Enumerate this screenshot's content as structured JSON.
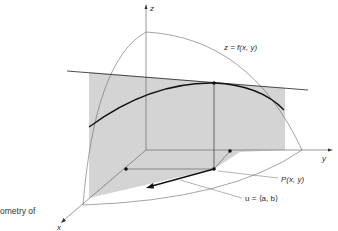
{
  "figure": {
    "caption_fragment": "ometry of",
    "axes": {
      "z_label": "z",
      "y_label": "y",
      "x_label": "x"
    },
    "annotations": {
      "surface_label": "z  = f(x, y)",
      "point_label": "P(x, y)",
      "vector_label": "u = ⟨a, b⟩"
    },
    "colors": {
      "shading": "#d4d4d4",
      "lines": "#222222",
      "thin_lines": "#555555"
    }
  }
}
